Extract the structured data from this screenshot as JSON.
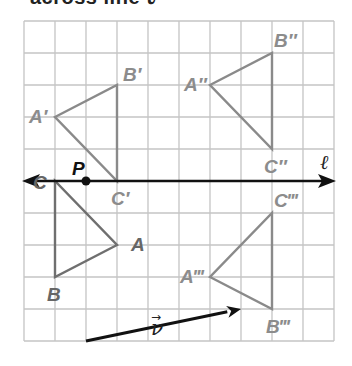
{
  "caption": "across line ℓ",
  "grid": {
    "x0": 24,
    "y0": 21,
    "cols": 10,
    "rows": 10,
    "cell_w": 31,
    "cell_h": 32,
    "color": "#c4c4c4"
  },
  "colors": {
    "triangle": "#8a8a8a",
    "original": "#6f6f6f",
    "line": "#111111"
  },
  "line_l": {
    "label": "ℓ",
    "row": 5
  },
  "point_P": {
    "label": "P",
    "col": 2,
    "row": 5
  },
  "vector_v": {
    "label": "v⃗",
    "from": [
      2,
      10
    ],
    "to": [
      7,
      9
    ]
  },
  "triangles": [
    {
      "name": "ABC",
      "points": {
        "A": [
          3,
          7
        ],
        "B": [
          1,
          8
        ],
        "C": [
          1,
          5
        ]
      },
      "labels": {
        "A": "A",
        "B": "B",
        "C": "C"
      }
    },
    {
      "name": "A'B'C'",
      "points": {
        "A": [
          1,
          3
        ],
        "B": [
          3,
          2
        ],
        "C": [
          3,
          5
        ]
      },
      "labels": {
        "A": "A′",
        "B": "B′",
        "C": "C′"
      }
    },
    {
      "name": "A''B''C''",
      "points": {
        "A": [
          6,
          2
        ],
        "B": [
          8,
          1
        ],
        "C": [
          8,
          4
        ]
      },
      "labels": {
        "A": "A″",
        "B": "B″",
        "C": "C″"
      }
    },
    {
      "name": "A'''B'''C'''",
      "points": {
        "A": [
          6,
          8
        ],
        "B": [
          8,
          9
        ],
        "C": [
          8,
          6
        ]
      },
      "labels": {
        "A": "A‴",
        "B": "B‴",
        "C": "C‴"
      }
    }
  ]
}
